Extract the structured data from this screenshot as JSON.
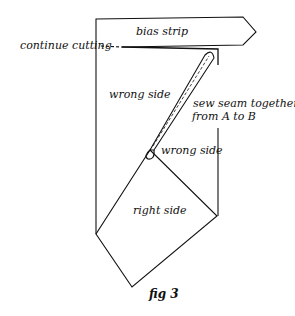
{
  "figure": {
    "caption": "fig 3",
    "labels": {
      "bias_strip": "bias strip",
      "continue_cutting": "continue cutting",
      "wrong_side_left": "wrong side",
      "sew_seam_line1": "sew seam together",
      "sew_seam_line2": "from A to B",
      "wrong_side_fold": "wrong side",
      "right_side": "right side"
    }
  }
}
